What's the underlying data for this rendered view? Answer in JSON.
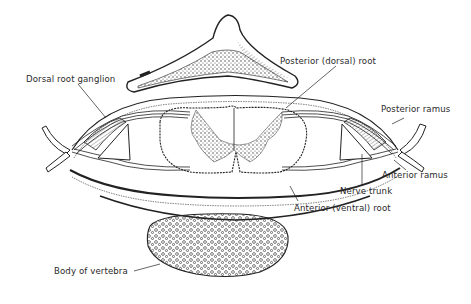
{
  "diagram": {
    "type": "anatomical cross-section",
    "colors": {
      "ink": "#222222",
      "background": "#ffffff",
      "label": "#2a2a2a"
    }
  },
  "labels": {
    "dorsal_root_ganglion": "Dorsal root ganglion",
    "posterior_dorsal_root": "Posterior (dorsal) root",
    "posterior_ramus": "Posterior ramus",
    "anterior_ramus": "Anterior ramus",
    "nerve_trunk": "Nerve trunk",
    "anterior_ventral_root": "Anterior (ventral) root",
    "body_of_vertebra": "Body of vertebra"
  }
}
